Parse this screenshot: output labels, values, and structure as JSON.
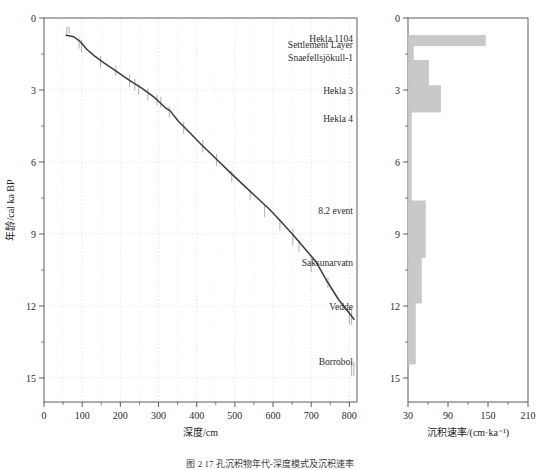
{
  "figure": {
    "caption": "图 2  17 孔沉积物年代-深度模式及沉积速率",
    "background": "#ffffff",
    "curve_color": "#3b3b3b",
    "bar_color": "#c9c9c9",
    "bar_edge_color": "#bdbdbd",
    "grid_color": "#d8d8d8",
    "axis_color": "#4a4a4a"
  },
  "chart_data": [
    {
      "type": "line",
      "id": "age-depth-model",
      "title": "",
      "xlabel": "深度/cm",
      "ylabel": "年龄/cal ka BP",
      "xlim": [
        0,
        820
      ],
      "ylim": [
        0,
        16
      ],
      "y_inverted": true,
      "grid": true,
      "legend": "none",
      "xticks": [
        0,
        100,
        200,
        300,
        400,
        500,
        600,
        700,
        800
      ],
      "xtick_labels": [
        "0",
        "100",
        "200",
        "300",
        "400",
        "500",
        "600",
        "700",
        "800"
      ],
      "xminor_step": 50,
      "yticks": [
        0,
        3,
        6,
        9,
        12,
        15
      ],
      "ytick_labels": [
        "0",
        "3",
        "6",
        "9",
        "12",
        "15"
      ],
      "yminor_step": 1.5,
      "series": [
        {
          "name": "年龄-深度曲线",
          "x": [
            58,
            78,
            96,
            112,
            132,
            158,
            190,
            222,
            258,
            290,
            318,
            330,
            352,
            382,
            414,
            448,
            484,
            520,
            556,
            590,
            622,
            654,
            688,
            712,
            742,
            772,
            800,
            812
          ],
          "y": [
            0.72,
            0.78,
            1.0,
            1.3,
            1.58,
            1.88,
            2.22,
            2.58,
            2.94,
            3.32,
            3.74,
            3.86,
            4.3,
            4.78,
            5.3,
            5.82,
            6.38,
            6.92,
            7.46,
            7.96,
            8.5,
            9.06,
            9.7,
            10.14,
            10.98,
            11.74,
            12.3,
            12.55
          ]
        }
      ],
      "error_bars": [
        {
          "x": 60,
          "y": 0.52,
          "err": 0.16
        },
        {
          "x": 66,
          "y": 0.5,
          "err": 0.14
        },
        {
          "x": 92,
          "y": 1.06,
          "err": 0.22
        },
        {
          "x": 98,
          "y": 1.16,
          "err": 0.26
        },
        {
          "x": 148,
          "y": 1.82,
          "err": 0.24
        },
        {
          "x": 188,
          "y": 2.18,
          "err": 0.2
        },
        {
          "x": 224,
          "y": 2.62,
          "err": 0.26
        },
        {
          "x": 238,
          "y": 2.78,
          "err": 0.24
        },
        {
          "x": 248,
          "y": 2.96,
          "err": 0.22
        },
        {
          "x": 272,
          "y": 3.18,
          "err": 0.24
        },
        {
          "x": 296,
          "y": 3.42,
          "err": 0.22
        },
        {
          "x": 306,
          "y": 3.5,
          "err": 0.22
        },
        {
          "x": 328,
          "y": 3.92,
          "err": 0.22
        },
        {
          "x": 366,
          "y": 4.58,
          "err": 0.26
        },
        {
          "x": 416,
          "y": 5.34,
          "err": 0.26
        },
        {
          "x": 452,
          "y": 5.92,
          "err": 0.24
        },
        {
          "x": 492,
          "y": 6.6,
          "err": 0.24
        },
        {
          "x": 540,
          "y": 7.38,
          "err": 0.22
        },
        {
          "x": 578,
          "y": 8.04,
          "err": 0.26
        },
        {
          "x": 618,
          "y": 8.62,
          "err": 0.24
        },
        {
          "x": 652,
          "y": 9.14,
          "err": 0.34
        },
        {
          "x": 668,
          "y": 9.52,
          "err": 0.24
        },
        {
          "x": 700,
          "y": 10.28,
          "err": 0.32
        },
        {
          "x": 744,
          "y": 11.02,
          "err": 0.22
        },
        {
          "x": 800,
          "y": 12.4,
          "err": 0.36
        },
        {
          "x": 806,
          "y": 12.44,
          "err": 0.36
        },
        {
          "x": 806,
          "y": 14.62,
          "err": 0.3
        },
        {
          "x": 812,
          "y": 14.62,
          "err": 0.3
        }
      ],
      "annotations": [
        {
          "label": "Hekla 1104",
          "age": 0.86
        },
        {
          "label": "Settlement Layer",
          "age": 1.12
        },
        {
          "label": "Snaefellsjökull-1",
          "age": 1.66
        },
        {
          "label": "Hekla 3",
          "age": 3.0
        },
        {
          "label": "Hekla 4",
          "age": 4.2
        },
        {
          "label": "8.2 event",
          "age": 8.0
        },
        {
          "label": "Saksunarvatn",
          "age": 10.2
        },
        {
          "label": "Vedde",
          "age": 12.0
        },
        {
          "label": "Borrobol",
          "age": 14.3
        }
      ]
    },
    {
      "type": "bar",
      "id": "sedimentation-rate",
      "orientation": "horizontal-step",
      "title": "",
      "xlabel": "沉积速率/(cm·ka⁻¹)",
      "ylabel": "",
      "xlim": [
        30,
        210
      ],
      "ylim": [
        0,
        16
      ],
      "y_inverted": true,
      "grid": false,
      "legend": "none",
      "xticks": [
        30,
        90,
        150,
        210
      ],
      "xtick_labels": [
        "30",
        "90",
        "150",
        "210"
      ],
      "xminor_step": 30,
      "yticks": [
        0,
        3,
        6,
        9,
        12,
        15
      ],
      "ytick_labels": [
        "0",
        "3",
        "6",
        "9",
        "12",
        "15"
      ],
      "yminor_step": 1.5,
      "bars": [
        {
          "age_top": 0.72,
          "age_bottom": 1.16,
          "rate": 146
        },
        {
          "age_top": 1.16,
          "age_bottom": 1.76,
          "rate": 38
        },
        {
          "age_top": 1.76,
          "age_bottom": 2.82,
          "rate": 61
        },
        {
          "age_top": 2.82,
          "age_bottom": 3.92,
          "rate": 79
        },
        {
          "age_top": 3.92,
          "age_bottom": 7.62,
          "rate": 35
        },
        {
          "age_top": 7.62,
          "age_bottom": 9.98,
          "rate": 56
        },
        {
          "age_top": 9.98,
          "age_bottom": 11.88,
          "rate": 50
        },
        {
          "age_top": 11.88,
          "age_bottom": 14.42,
          "rate": 41
        }
      ]
    }
  ]
}
